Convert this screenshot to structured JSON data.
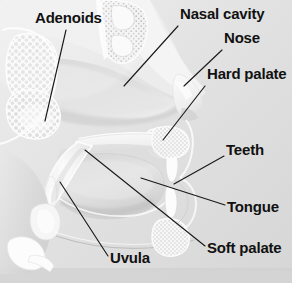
{
  "figure": {
    "width": 292,
    "height": 283,
    "background_color": "#dcdcdc",
    "background_color_light": "#ececec",
    "bottom_band_color": "#d2d2d2",
    "label_color": "#111111",
    "leader_color": "#1a1a1a",
    "tissue_light": "#f6f6f6",
    "tissue_mid": "#dedede",
    "tissue_shadow": "#b9b9b9",
    "bone_white": "#fbfbfb",
    "cavity_dark": "#c2c2c2"
  },
  "labels": [
    {
      "id": "adenoids",
      "text": "Adenoids",
      "x": 35,
      "y": 10,
      "leader": {
        "x1": 66,
        "y1": 30,
        "x2": 45,
        "y2": 121
      }
    },
    {
      "id": "nasal-cavity",
      "text": "Nasal cavity",
      "x": 180,
      "y": 6,
      "leader": {
        "x1": 178,
        "y1": 26,
        "x2": 124,
        "y2": 86
      }
    },
    {
      "id": "nose",
      "text": "Nose",
      "x": 224,
      "y": 30,
      "leader": {
        "x1": 222,
        "y1": 50,
        "x2": 184,
        "y2": 86
      }
    },
    {
      "id": "hard-palate",
      "text": "Hard palate",
      "x": 207,
      "y": 66,
      "leader": {
        "x1": 205,
        "y1": 86,
        "x2": 163,
        "y2": 140
      }
    },
    {
      "id": "teeth",
      "text": "Teeth",
      "x": 226,
      "y": 142,
      "leader": {
        "x1": 224,
        "y1": 156,
        "x2": 174,
        "y2": 184
      }
    },
    {
      "id": "tongue",
      "text": "Tongue",
      "x": 227,
      "y": 199,
      "leader": {
        "x1": 225,
        "y1": 205,
        "x2": 141,
        "y2": 178
      }
    },
    {
      "id": "soft-palate",
      "text": "Soft palate",
      "x": 207,
      "y": 240,
      "leader": {
        "x1": 205,
        "y1": 246,
        "x2": 85,
        "y2": 150
      }
    },
    {
      "id": "uvula",
      "text": "Uvula",
      "x": 110,
      "y": 250,
      "leader": {
        "x1": 108,
        "y1": 256,
        "x2": 60,
        "y2": 182
      }
    }
  ]
}
